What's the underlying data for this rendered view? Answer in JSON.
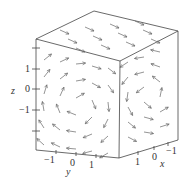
{
  "chart_data": {
    "type": "vector_field_3d",
    "title": "",
    "xlabel": "x",
    "ylabel": "y",
    "zlabel": "z",
    "x_ticks": [
      "-1",
      "0",
      "1"
    ],
    "y_ticks": [
      "-1",
      "0",
      "1"
    ],
    "z_ticks": [
      "-1",
      "0",
      "1"
    ],
    "xlim": [
      -1.5,
      1.5
    ],
    "ylim": [
      -1.5,
      1.5
    ],
    "zlim": [
      -1.5,
      1.5
    ],
    "box": true,
    "grid": false,
    "arrow_color": "#555555",
    "box_color": "#444444"
  },
  "labels": {
    "z_axis": "z",
    "y_axis": "y",
    "x_axis": "x",
    "z_tick_pos": "1",
    "z_tick_zero": "0",
    "z_tick_neg": "−1",
    "y_tick_neg": "−1",
    "y_tick_zero": "0",
    "y_tick_pos": "1",
    "x_tick_pos": "1",
    "x_tick_zero": "0",
    "x_tick_neg": "−1"
  }
}
